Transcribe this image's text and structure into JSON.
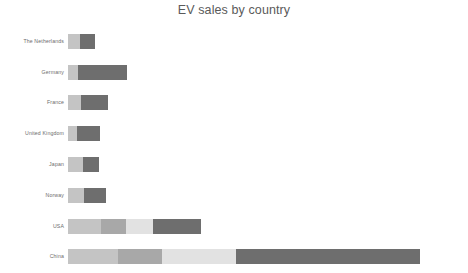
{
  "chart": {
    "title": "EV sales by country",
    "background": "#ffffff",
    "title_color": "#5a5a5a",
    "label_color": "#6b6b6b"
  },
  "chart_data": {
    "type": "bar",
    "orientation": "horizontal",
    "stacked": true,
    "title": "EV sales by country",
    "xlabel": "",
    "ylabel": "",
    "grid": false,
    "legend": "none",
    "axis_visible": false,
    "tick_labels_x": [],
    "categories": [
      "The Netherlands",
      "Germany",
      "France",
      "United Kingdom",
      "Japan",
      "Norway",
      "USA",
      "China"
    ],
    "series": [
      {
        "name": "segment-1",
        "color": "#c4c4c4",
        "values": [
          12,
          10,
          13,
          9,
          15,
          16,
          33,
          50
        ]
      },
      {
        "name": "segment-2",
        "color": "#a8a8a8",
        "values": [
          0,
          0,
          0,
          0,
          0,
          0,
          25,
          44
        ]
      },
      {
        "name": "segment-3",
        "color": "#e2e2e2",
        "values": [
          0,
          0,
          0,
          0,
          0,
          0,
          27,
          74
        ]
      },
      {
        "name": "segment-4",
        "color": "#6e6e6e",
        "values": [
          15,
          49,
          27,
          23,
          16,
          22,
          48,
          184
        ]
      }
    ],
    "totals": [
      27,
      59,
      40,
      32,
      31,
      38,
      133,
      352
    ],
    "xlim": [
      0,
      352
    ],
    "bars": [
      {
        "category": "The Netherlands",
        "total": 27,
        "segments": [
          {
            "color": "#c4c4c4",
            "value": 12
          },
          {
            "color": "#6e6e6e",
            "value": 15
          }
        ]
      },
      {
        "category": "Germany",
        "total": 59,
        "segments": [
          {
            "color": "#c4c4c4",
            "value": 10
          },
          {
            "color": "#6e6e6e",
            "value": 49
          }
        ]
      },
      {
        "category": "France",
        "total": 40,
        "segments": [
          {
            "color": "#c4c4c4",
            "value": 13
          },
          {
            "color": "#6e6e6e",
            "value": 27
          }
        ]
      },
      {
        "category": "United Kingdom",
        "total": 32,
        "segments": [
          {
            "color": "#c4c4c4",
            "value": 9
          },
          {
            "color": "#6e6e6e",
            "value": 23
          }
        ]
      },
      {
        "category": "Japan",
        "total": 31,
        "segments": [
          {
            "color": "#c4c4c4",
            "value": 15
          },
          {
            "color": "#6e6e6e",
            "value": 16
          }
        ]
      },
      {
        "category": "Norway",
        "total": 38,
        "segments": [
          {
            "color": "#c4c4c4",
            "value": 16
          },
          {
            "color": "#6e6e6e",
            "value": 22
          }
        ]
      },
      {
        "category": "USA",
        "total": 133,
        "segments": [
          {
            "color": "#c4c4c4",
            "value": 33
          },
          {
            "color": "#a8a8a8",
            "value": 25
          },
          {
            "color": "#e2e2e2",
            "value": 27
          },
          {
            "color": "#6e6e6e",
            "value": 48
          }
        ]
      },
      {
        "category": "China",
        "total": 352,
        "segments": [
          {
            "color": "#c4c4c4",
            "value": 50
          },
          {
            "color": "#a8a8a8",
            "value": 44
          },
          {
            "color": "#e2e2e2",
            "value": 74
          },
          {
            "color": "#6e6e6e",
            "value": 184
          }
        ]
      }
    ]
  }
}
